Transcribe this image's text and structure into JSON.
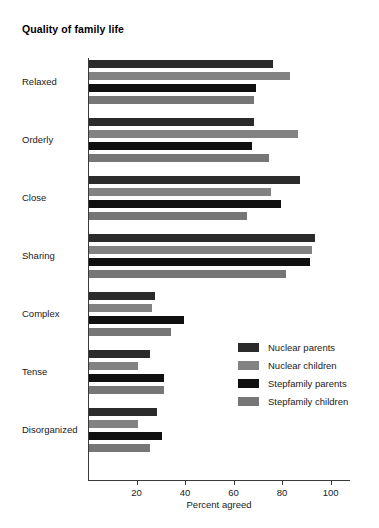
{
  "chart_data": {
    "type": "bar",
    "orientation": "horizontal",
    "title": "Quality of family life",
    "xlabel": "Percent agreed",
    "ylabel": "",
    "xlim": [
      0,
      108
    ],
    "xticks": [
      20,
      40,
      60,
      80,
      100
    ],
    "xtick_labels": [
      "20",
      "40",
      "60",
      "80",
      "100"
    ],
    "grid": false,
    "legend_position": "center-right",
    "categories": [
      "Relaxed",
      "Orderly",
      "Close",
      "Sharing",
      "Complex",
      "Tense",
      "Disorganized"
    ],
    "series": [
      {
        "name": "Nuclear parents",
        "color": "#2b2b2b",
        "values": [
          76,
          68,
          87,
          93,
          27,
          25,
          28
        ]
      },
      {
        "name": "Nuclear children",
        "color": "#828282",
        "values": [
          83,
          86,
          75,
          92,
          26,
          20,
          20
        ]
      },
      {
        "name": "Stepfamily parents",
        "color": "#101010",
        "values": [
          69,
          67,
          79,
          91,
          39,
          31,
          30
        ]
      },
      {
        "name": "Stepfamily children",
        "color": "#767676",
        "values": [
          68,
          74,
          65,
          81,
          34,
          31,
          25
        ]
      }
    ]
  },
  "legend": {
    "items": [
      {
        "label": "Nuclear parents",
        "color": "#2b2b2b"
      },
      {
        "label": "Nuclear children",
        "color": "#828282"
      },
      {
        "label": "Stepfamily parents",
        "color": "#101010"
      },
      {
        "label": "Stepfamily children",
        "color": "#767676"
      }
    ]
  },
  "colors": {
    "axis": "#3a3a3a",
    "text": "#1a1a1a",
    "background": "#ffffff"
  }
}
